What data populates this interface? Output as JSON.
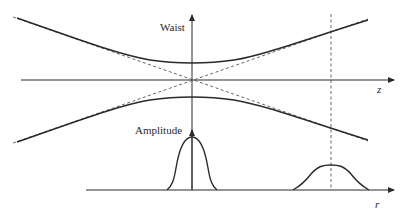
{
  "diagram": {
    "labels": {
      "waist_axis": "Waist",
      "propagation_axis": "z",
      "amplitude_axis": "Amplitude",
      "radial_axis": "r"
    },
    "colors": {
      "line": "#2a2a2a",
      "dashed": "#555555",
      "background": "#ffffff"
    },
    "elements": {
      "beam_envelope": "hyperbolic beam envelope (solid)",
      "asymptotes": "far-field asymptotes (dashed) crossing at waist",
      "reference_plane": "dashed vertical line at far z position",
      "profile_at_waist": "narrow tall Gaussian amplitude profile",
      "profile_far_field": "wide short Gaussian amplitude profile"
    }
  }
}
